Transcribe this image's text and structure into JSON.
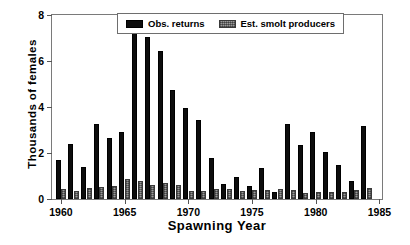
{
  "chart_data": {
    "type": "bar",
    "title": "",
    "xlabel": "Spawning Year",
    "ylabel": "Thousands of females",
    "xlim": [
      1959.3,
      1985.2
    ],
    "ylim": [
      0,
      8
    ],
    "grid": false,
    "legend_position": "top-center",
    "xticks": [
      1960,
      1965,
      1970,
      1975,
      1980,
      1985
    ],
    "xtick_labels": [
      "1960",
      "1965",
      "1970",
      "1975",
      "1980",
      "1985"
    ],
    "yticks": [
      0,
      2,
      4,
      6,
      8
    ],
    "ytick_labels": [
      "0",
      "2",
      "4",
      "6",
      "8"
    ],
    "categories": [
      1960,
      1961,
      1962,
      1963,
      1964,
      1965,
      1966,
      1967,
      1968,
      1969,
      1970,
      1971,
      1972,
      1973,
      1974,
      1975,
      1976,
      1977,
      1978,
      1979,
      1980,
      1981,
      1982,
      1983,
      1984
    ],
    "series": [
      {
        "name": "Obs. returns",
        "color": "#0d0d0d",
        "values": [
          1.7,
          2.4,
          1.4,
          3.25,
          2.65,
          2.9,
          7.65,
          7.05,
          6.45,
          4.75,
          3.95,
          3.45,
          1.78,
          0.66,
          0.95,
          0.55,
          1.35,
          0.32,
          3.25,
          2.36,
          2.9,
          2.05,
          1.47,
          0.77,
          3.18
        ]
      },
      {
        "name": "Est. smolt producers",
        "color": "#9a9a9a",
        "values": [
          0.45,
          0.33,
          0.48,
          0.54,
          0.57,
          0.87,
          0.8,
          0.61,
          0.7,
          0.6,
          0.35,
          0.36,
          0.42,
          0.45,
          0.37,
          0.4,
          0.4,
          0.42,
          0.4,
          0.25,
          0.3,
          0.3,
          0.31,
          0.38,
          0.49
        ]
      }
    ]
  },
  "legend": {
    "items": [
      {
        "label": "Obs. returns",
        "swatch": "black-bar-swatch"
      },
      {
        "label": "Est. smolt producers",
        "swatch": "gray-stippled-bar-swatch"
      }
    ]
  },
  "axes": {
    "x_title": "Spawning Year",
    "y_title": "Thousands of females"
  }
}
